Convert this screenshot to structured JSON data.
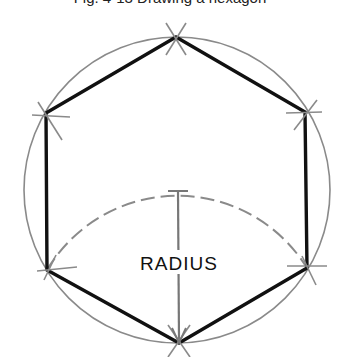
{
  "caption": "Fig. 4-13   Drawing a hexagon",
  "label": "RADIUS",
  "geometry": {
    "center": [
      177,
      190
    ],
    "radius": 153,
    "vertices": [
      [
        176,
        37
      ],
      [
        305,
        112
      ],
      [
        307,
        268
      ],
      [
        179,
        343
      ],
      [
        47,
        270
      ],
      [
        46,
        113
      ]
    ],
    "arc_center": [
      179,
      343
    ],
    "arc_radius": 152
  },
  "colors": {
    "hexagon": "#111111",
    "circle": "#8a8a8a",
    "construction": "#8a8a8a",
    "background": "#ffffff"
  }
}
